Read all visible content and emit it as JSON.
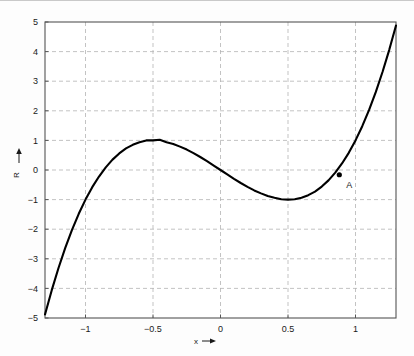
{
  "figure": {
    "background_color": "#fdfdfd",
    "frame_color": "#555555",
    "grid_color": "#b4b4b4",
    "curve_color": "#000000",
    "text_color": "#1a1a1a"
  },
  "axes": {
    "x_axis_label_text": "x",
    "x_axis_label_arrow": "→",
    "y_axis_label_text": "R",
    "y_axis_label_arrow": "↑",
    "x_ticks": [
      "−1",
      "−0.5",
      "0",
      "0.5",
      "1"
    ],
    "x_tick_values": [
      -1,
      -0.5,
      0,
      0.5,
      1
    ],
    "y_ticks": [
      "5",
      "4",
      "3",
      "2",
      "1",
      "0",
      "−1",
      "−2",
      "−3",
      "−4",
      "−5"
    ],
    "y_tick_values": [
      5,
      4,
      3,
      2,
      1,
      0,
      -1,
      -2,
      -3,
      -4,
      -5
    ]
  },
  "annotations": {
    "point_a": {
      "label": "A",
      "x": 0.88,
      "y": -0.16
    }
  },
  "chart_data": {
    "type": "line",
    "title": "",
    "xlabel": "x→",
    "ylabel": "R↑",
    "xlim": [
      -1.3,
      1.3
    ],
    "ylim": [
      -5,
      5
    ],
    "grid": true,
    "legend": null,
    "function": "R = 4x^3 - 3x",
    "series": [
      {
        "name": "R(x)",
        "color": "#000000",
        "x": [
          -1.3,
          -1.25,
          -1.2,
          -1.15,
          -1.1,
          -1.05,
          -1.0,
          -0.95,
          -0.9,
          -0.85,
          -0.8,
          -0.75,
          -0.7,
          -0.65,
          -0.6,
          -0.55,
          -0.5,
          -0.45,
          -0.4,
          -0.35,
          -0.3,
          -0.25,
          -0.2,
          -0.15,
          -0.1,
          -0.05,
          0.0,
          0.05,
          0.1,
          0.15,
          0.2,
          0.25,
          0.3,
          0.35,
          0.4,
          0.45,
          0.5,
          0.55,
          0.6,
          0.65,
          0.7,
          0.75,
          0.8,
          0.85,
          0.9,
          0.95,
          1.0,
          1.05,
          1.1,
          1.15,
          1.2,
          1.25,
          1.3
        ],
        "y": [
          -4.88,
          -4.06,
          -3.31,
          -2.63,
          -2.02,
          -1.48,
          -1.0,
          -0.58,
          -0.22,
          0.09,
          0.35,
          0.56,
          0.73,
          0.85,
          0.94,
          1.0,
          1.0,
          1.02,
          0.94,
          0.88,
          0.79,
          0.69,
          0.57,
          0.44,
          0.3,
          0.15,
          0.0,
          -0.15,
          -0.3,
          -0.44,
          -0.57,
          -0.69,
          -0.79,
          -0.88,
          -0.94,
          -0.99,
          -1.0,
          -0.99,
          -0.94,
          -0.85,
          -0.73,
          -0.56,
          -0.35,
          -0.09,
          0.22,
          0.58,
          1.0,
          1.48,
          2.02,
          2.63,
          3.31,
          4.06,
          4.88
        ]
      }
    ],
    "annotated_points": [
      {
        "label": "A",
        "x": 0.88,
        "y": -0.16
      }
    ]
  }
}
